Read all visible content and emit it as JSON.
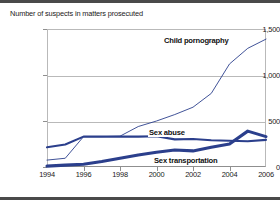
{
  "chart_data": {
    "type": "line",
    "title": "Number of suspects in matters prosecuted",
    "xlabel": "",
    "ylabel": "",
    "x": [
      1994,
      1995,
      1996,
      1997,
      1998,
      1999,
      2000,
      2001,
      2002,
      2003,
      2004,
      2005,
      2006
    ],
    "xlim": [
      1994,
      2006
    ],
    "ylim": [
      0,
      1500
    ],
    "yticks": [
      0,
      500,
      1000,
      1500
    ],
    "ytick_labels": [
      "0",
      "500",
      "1,000",
      "1,500"
    ],
    "xticks": [
      1994,
      1996,
      1998,
      2000,
      2002,
      2004,
      2006
    ],
    "xtick_labels": [
      "1994",
      "1996",
      "1998",
      "2000",
      "2002",
      "2004",
      "2006"
    ],
    "grid": true,
    "legend": "inline-annotations",
    "series": [
      {
        "name": "Child pornography",
        "values": [
          75,
          95,
          330,
          330,
          335,
          440,
          500,
          570,
          650,
          800,
          1120,
          1290,
          1390
        ]
      },
      {
        "name": "Sex abuse",
        "values": [
          215,
          245,
          330,
          330,
          330,
          330,
          335,
          300,
          305,
          290,
          285,
          280,
          295
        ]
      },
      {
        "name": "Sex transportation",
        "values": [
          10,
          20,
          30,
          60,
          95,
          130,
          160,
          185,
          175,
          215,
          250,
          390,
          330
        ]
      }
    ]
  },
  "annotations": {
    "child_pornography": "Child pornography",
    "sex_abuse": "Sex abuse",
    "sex_transportation": "Sex transportation"
  },
  "colors": {
    "series_line": "#2b3f8c",
    "grid": "#b9b9b9",
    "axis": "#8f8f8f",
    "rule": "#4a4a4a",
    "text": "#1a1a1a"
  }
}
